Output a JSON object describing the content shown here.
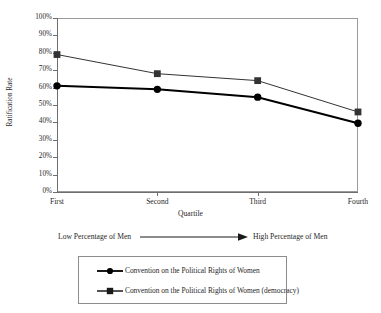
{
  "chart_data": {
    "type": "line",
    "title": "",
    "xlabel": "Quartile",
    "ylabel": "Ratification Rate",
    "categories": [
      "First",
      "Second",
      "Third",
      "Fourth"
    ],
    "ylim": [
      0,
      100
    ],
    "ytick_labels": [
      "100%",
      "90%",
      "80%",
      "70%",
      "60%",
      "50%",
      "40%",
      "30%",
      "20%",
      "10%",
      "0%"
    ],
    "ytick_values": [
      100,
      90,
      80,
      70,
      60,
      50,
      40,
      30,
      20,
      10,
      0
    ],
    "grid": false,
    "legend_position": "below-plot",
    "series": [
      {
        "name": "Convention on the Political Rights of Women",
        "marker": "circle",
        "color": "#000000",
        "line_width": 2,
        "values": [
          61,
          59,
          54.5,
          39.5
        ]
      },
      {
        "name": "Convention on the Political Rights of Women (democracy)",
        "marker": "square",
        "color": "#333333",
        "line_width": 1,
        "values": [
          79,
          68,
          64,
          46
        ]
      }
    ],
    "annotation": {
      "left_label": "Low Percentage of Men",
      "right_label": "High Percentage of Men",
      "arrow": "right-arrow"
    }
  }
}
